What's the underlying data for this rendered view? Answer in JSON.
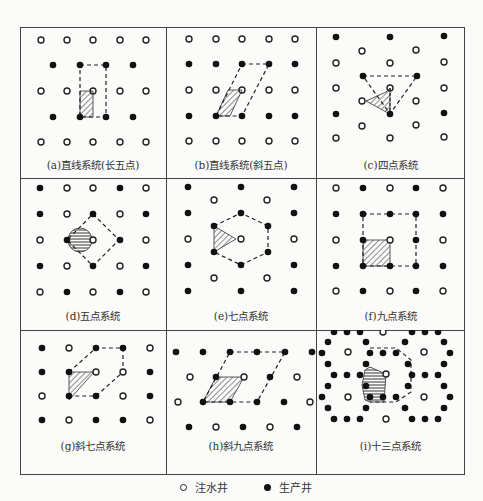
{
  "figure": {
    "panels": [
      {
        "id": "a",
        "caption": "(a)直线系统(长五点)"
      },
      {
        "id": "b",
        "caption": "(b)直线系统(斜五点)"
      },
      {
        "id": "c",
        "caption": "(c)四点系统"
      },
      {
        "id": "d",
        "caption": "(d)五点系统"
      },
      {
        "id": "e",
        "caption": "(e)七点系统"
      },
      {
        "id": "f",
        "caption": "(f)九点系统"
      },
      {
        "id": "g",
        "caption": "(g)斜七点系统"
      },
      {
        "id": "h",
        "caption": "(h)斜九点系统"
      },
      {
        "id": "i",
        "caption": "(i)十三点系统"
      }
    ],
    "legend": [
      {
        "symbol": "open-circle",
        "label": "注水井"
      },
      {
        "symbol": "filled-circle",
        "label": "生产井"
      }
    ]
  }
}
